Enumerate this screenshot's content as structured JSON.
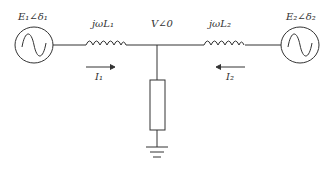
{
  "diagram": {
    "type": "circuit",
    "labels": {
      "source1": "E₁∠δ₁",
      "source2": "E₂∠δ₂",
      "inductor1": "jωL₁",
      "inductor2": "jωL₂",
      "node_voltage": "V∠0",
      "current1": "I₁",
      "current2": "I₂"
    },
    "components": [
      {
        "id": "source1",
        "kind": "ac-voltage-source"
      },
      {
        "id": "inductor1",
        "kind": "inductor"
      },
      {
        "id": "load",
        "kind": "resistor-impedance"
      },
      {
        "id": "ground",
        "kind": "ground"
      },
      {
        "id": "inductor2",
        "kind": "inductor"
      },
      {
        "id": "source2",
        "kind": "ac-voltage-source"
      }
    ],
    "colors": {
      "stroke": "#333333",
      "background": "#ffffff"
    }
  }
}
